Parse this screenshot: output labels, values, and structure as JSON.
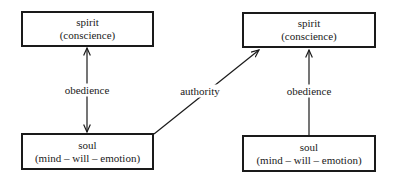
{
  "diagram": {
    "type": "flow",
    "nodes": [
      {
        "id": "spirit_left",
        "title": "spirit",
        "subtitle": "(conscience)"
      },
      {
        "id": "soul_left",
        "title": "soul",
        "subtitle": "(mind – will – emotion)"
      },
      {
        "id": "spirit_right",
        "title": "spirit",
        "subtitle": "(conscience)"
      },
      {
        "id": "soul_right",
        "title": "soul",
        "subtitle": "(mind – will – emotion)"
      }
    ],
    "edges": [
      {
        "from": "soul_left",
        "to": "spirit_left",
        "label": "obedience",
        "direction": "both"
      },
      {
        "from": "soul_left",
        "to": "spirit_right",
        "label": "authority",
        "direction": "forward"
      },
      {
        "from": "soul_right",
        "to": "spirit_right",
        "label": "obedience",
        "direction": "forward"
      }
    ]
  },
  "colors": {
    "line": "#1a1a1a",
    "background": "#ffffff"
  }
}
